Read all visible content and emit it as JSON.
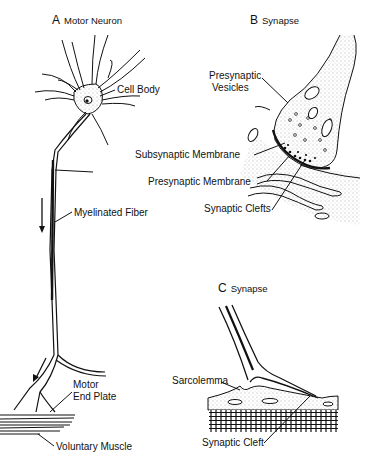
{
  "panels": {
    "a": {
      "letter": "A",
      "title": "Motor Neuron"
    },
    "b": {
      "letter": "B",
      "title": "Synapse"
    },
    "c": {
      "letter": "C",
      "title": "Synapse"
    }
  },
  "labels": {
    "cell_body": "Cell Body",
    "myelinated_fiber": "Myelinated Fiber",
    "motor_end_plate_1": "Motor",
    "motor_end_plate_2": "End Plate",
    "voluntary_muscle": "Voluntary Muscle",
    "presynaptic_vesicles_1": "Presynaptic",
    "presynaptic_vesicles_2": "Vesicles",
    "subsynaptic_membrane": "Subsynaptic Membrane",
    "presynaptic_membrane": "Presynaptic Membrane",
    "synaptic_clefts": "Synaptic Clefts",
    "sarcolemma": "Sarcolemma",
    "synaptic_cleft": "Synaptic Cleft"
  },
  "colors": {
    "ink": "#111111",
    "background": "#ffffff",
    "stipple": "#555555"
  }
}
